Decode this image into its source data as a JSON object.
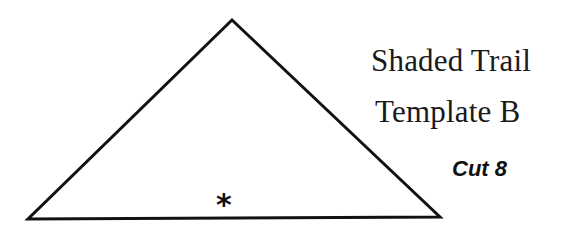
{
  "template": {
    "title_line_1": "Shaded Trail",
    "title_line_2": "Template B",
    "cut_instruction": "Cut 8",
    "grain_marker": "*"
  },
  "shape": {
    "type": "triangle",
    "points": "232,20 28,219 440,217",
    "stroke": "#111111",
    "fill": "#ffffff",
    "stroke_width": "3"
  }
}
